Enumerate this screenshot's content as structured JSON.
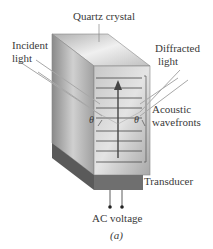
{
  "labels": {
    "quartz_crystal": "Quartz crystal",
    "incident_light_1": "Incident",
    "incident_light_2": "light",
    "diffracted_light_1": "Diffracted",
    "diffracted_light_2": "light",
    "acoustic_1": "Acoustic",
    "acoustic_2": "wavefronts",
    "theta_left": "θ",
    "theta_right": "θ",
    "transducer": "Transducer",
    "ac_voltage": "AC voltage",
    "caption": "(a)"
  },
  "colors": {
    "crystal_front": "#b9b9b9",
    "crystal_side": "#9c9c9c",
    "crystal_top": "#d4d4d4",
    "wavefront_line": "#555555",
    "transducer": "#6f6f6f",
    "light_ray": "#aaaaaa"
  },
  "wavefront_count": 9
}
